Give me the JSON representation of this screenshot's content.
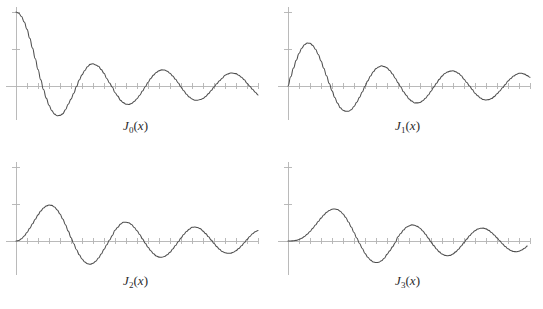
{
  "figure": {
    "background_color": "#ffffff",
    "curve_color": "#4d4d4d",
    "axis_color": "#b3b3b3",
    "label_color": "#2b2b2b"
  },
  "panels": [
    {
      "name": "panel-j0",
      "label_fn": "J",
      "label_sub": "0",
      "label_open": "(",
      "label_arg": "x",
      "label_close": ")",
      "label_text": "J0(x)",
      "order": 0
    },
    {
      "name": "panel-j1",
      "label_fn": "J",
      "label_sub": "1",
      "label_open": "(",
      "label_arg": "x",
      "label_close": ")",
      "label_text": "J1(x)",
      "order": 1
    },
    {
      "name": "panel-j2",
      "label_fn": "J",
      "label_sub": "2",
      "label_open": "(",
      "label_arg": "x",
      "label_close": ")",
      "label_text": "J2(x)",
      "order": 2
    },
    {
      "name": "panel-j3",
      "label_fn": "J",
      "label_sub": "3",
      "label_open": "(",
      "label_arg": "x",
      "label_close": ")",
      "label_text": "J3(x)",
      "order": 3
    }
  ],
  "chart_data": [
    {
      "type": "line",
      "title": "J0(x)",
      "xlabel": "",
      "ylabel": "",
      "xlim": [
        0,
        22
      ],
      "ylim": [
        -0.7,
        1.1
      ],
      "grid": false,
      "legend": "none",
      "axis_ticks": {
        "x_step": 1,
        "x_ticks": [
          0,
          1,
          2,
          3,
          4,
          5,
          6,
          7,
          8,
          9,
          10,
          11,
          12,
          13,
          14,
          15,
          16,
          17,
          18,
          19,
          20,
          21,
          22
        ],
        "y_ticks": [
          -0.5,
          0.0,
          0.5,
          1.0
        ]
      },
      "series": [
        {
          "name": "J0",
          "x": [
            0,
            0.25,
            0.5,
            0.75,
            1,
            1.25,
            1.5,
            1.75,
            2,
            2.25,
            2.5,
            2.75,
            3,
            3.25,
            3.5,
            3.75,
            4,
            4.25,
            4.5,
            4.75,
            5,
            5.25,
            5.5,
            5.75,
            6,
            6.25,
            6.5,
            6.75,
            7,
            7.25,
            7.5,
            7.75,
            8,
            8.25,
            8.5,
            8.75,
            9,
            9.25,
            9.5,
            9.75,
            10,
            10.25,
            10.5,
            10.75,
            11,
            11.25,
            11.5,
            11.75,
            12,
            12.25,
            12.5,
            12.75,
            13,
            13.25,
            13.5,
            13.75,
            14,
            14.25,
            14.5,
            14.75,
            15,
            15.25,
            15.5,
            15.75,
            16,
            16.25,
            16.5,
            16.75,
            17,
            17.25,
            17.5,
            17.75,
            18,
            18.25,
            18.5,
            18.75,
            19,
            19.25,
            19.5,
            19.75,
            20,
            20.25,
            20.5,
            20.75,
            21,
            21.25,
            21.5,
            21.75,
            22
          ],
          "values": [
            1.0,
            0.9844,
            0.9385,
            0.8642,
            0.7652,
            0.6459,
            0.5118,
            0.369,
            0.2239,
            0.0827,
            -0.0484,
            -0.1641,
            -0.2601,
            -0.3325,
            -0.3801,
            -0.4026,
            -0.3971,
            -0.3766,
            -0.3205,
            -0.2459,
            -0.1776,
            -0.0968,
            -0.0068,
            0.0802,
            0.1506,
            0.2095,
            0.2601,
            0.2921,
            0.3001,
            0.2851,
            0.2663,
            0.2214,
            0.1717,
            0.1024,
            0.0419,
            -0.0142,
            -0.0903,
            -0.1367,
            -0.1939,
            -0.2243,
            -0.2459,
            -0.249,
            -0.2366,
            -0.2097,
            -0.1712,
            -0.124,
            -0.0677,
            -0.0095,
            0.0477,
            0.1023,
            0.1469,
            0.1823,
            0.2069,
            0.2183,
            0.215,
            0.2005,
            0.1711,
            0.1339,
            0.0903,
            0.0415,
            -0.0142,
            -0.0648,
            -0.1114,
            -0.1498,
            -0.1749,
            -0.1912,
            -0.1928,
            -0.1831,
            -0.1699,
            -0.141,
            -0.1029,
            -0.0614,
            -0.0134,
            0.0297,
            0.0714,
            0.1057,
            0.1466,
            0.1624,
            0.1756,
            0.1732,
            0.167,
            0.1441,
            0.118,
            0.0836,
            0.0366,
            -0.0031,
            -0.0447,
            -0.0845,
            -0.1207
          ]
        }
      ]
    },
    {
      "type": "line",
      "title": "J1(x)",
      "xlabel": "",
      "ylabel": "",
      "xlim": [
        0,
        22
      ],
      "ylim": [
        -0.7,
        1.1
      ],
      "grid": false,
      "legend": "none",
      "axis_ticks": {
        "x_step": 1,
        "x_ticks": [
          0,
          1,
          2,
          3,
          4,
          5,
          6,
          7,
          8,
          9,
          10,
          11,
          12,
          13,
          14,
          15,
          16,
          17,
          18,
          19,
          20,
          21,
          22
        ],
        "y_ticks": [
          -0.5,
          0.0,
          0.5,
          1.0
        ]
      },
      "series": [
        {
          "name": "J1",
          "x": [
            0,
            0.25,
            0.5,
            0.75,
            1,
            1.25,
            1.5,
            1.75,
            2,
            2.25,
            2.5,
            2.75,
            3,
            3.25,
            3.5,
            3.75,
            4,
            4.25,
            4.5,
            4.75,
            5,
            5.25,
            5.5,
            5.75,
            6,
            6.25,
            6.5,
            6.75,
            7,
            7.25,
            7.5,
            7.75,
            8,
            8.25,
            8.5,
            8.75,
            9,
            9.25,
            9.5,
            9.75,
            10,
            10.25,
            10.5,
            10.75,
            11,
            11.25,
            11.5,
            11.75,
            12,
            12.25,
            12.5,
            12.75,
            13,
            13.25,
            13.5,
            13.75,
            14,
            14.25,
            14.5,
            14.75,
            15,
            15.25,
            15.5,
            15.75,
            16,
            16.25,
            16.5,
            16.75,
            17,
            17.25,
            17.5,
            17.75,
            18,
            18.25,
            18.5,
            18.75,
            19,
            19.25,
            19.5,
            19.75,
            20,
            20.25,
            20.5,
            20.75,
            21,
            21.25,
            21.5,
            21.75,
            22
          ],
          "values": [
            0.0,
            0.124,
            0.2423,
            0.3492,
            0.4401,
            0.5106,
            0.5579,
            0.5802,
            0.5767,
            0.5484,
            0.4971,
            0.426,
            0.3391,
            0.2412,
            0.1374,
            0.0333,
            -0.066,
            -0.1558,
            -0.2311,
            -0.2944,
            -0.3276,
            -0.3414,
            -0.3414,
            -0.3209,
            -0.2767,
            -0.2196,
            -0.1538,
            -0.0818,
            -0.0047,
            0.0693,
            0.1352,
            0.1934,
            0.2346,
            0.258,
            0.2731,
            0.2621,
            0.2453,
            0.2098,
            0.1613,
            0.1061,
            0.0435,
            -0.0134,
            -0.0789,
            -0.1244,
            -0.1768,
            -0.2037,
            -0.2284,
            -0.2282,
            -0.2234,
            -0.1987,
            -0.1655,
            -0.121,
            -0.0703,
            -0.015,
            0.038,
            0.0893,
            0.1334,
            0.1677,
            0.1895,
            0.2012,
            0.2051,
            0.1924,
            0.1711,
            0.1395,
            0.0904,
            0.0478,
            -0.0007,
            -0.0462,
            -0.0977,
            -0.1328,
            -0.1625,
            -0.1829,
            -0.188,
            -0.1839,
            -0.1695,
            -0.1435,
            -0.1057,
            -0.0678,
            -0.0244,
            0.0188,
            0.0668,
            0.101,
            0.1345,
            0.1553,
            0.1711,
            0.1719,
            0.1606,
            0.1404,
            0.1173
          ]
        }
      ]
    },
    {
      "type": "line",
      "title": "J2(x)",
      "xlabel": "",
      "ylabel": "",
      "xlim": [
        0,
        22
      ],
      "ylim": [
        -0.7,
        1.1
      ],
      "grid": false,
      "legend": "none",
      "axis_ticks": {
        "x_step": 1,
        "x_ticks": [
          0,
          1,
          2,
          3,
          4,
          5,
          6,
          7,
          8,
          9,
          10,
          11,
          12,
          13,
          14,
          15,
          16,
          17,
          18,
          19,
          20,
          21,
          22
        ],
        "y_ticks": [
          -0.5,
          0.0,
          0.5,
          1.0
        ]
      },
      "series": [
        {
          "name": "J2",
          "x": [
            0,
            0.25,
            0.5,
            0.75,
            1,
            1.25,
            1.5,
            1.75,
            2,
            2.25,
            2.5,
            2.75,
            3,
            3.25,
            3.5,
            3.75,
            4,
            4.25,
            4.5,
            4.75,
            5,
            5.25,
            5.5,
            5.75,
            6,
            6.25,
            6.5,
            6.75,
            7,
            7.25,
            7.5,
            7.75,
            8,
            8.25,
            8.5,
            8.75,
            9,
            9.25,
            9.5,
            9.75,
            10,
            10.25,
            10.5,
            10.75,
            11,
            11.25,
            11.5,
            11.75,
            12,
            12.25,
            12.5,
            12.75,
            13,
            13.25,
            13.5,
            13.75,
            14,
            14.25,
            14.5,
            14.75,
            15,
            15.25,
            15.5,
            15.75,
            16,
            16.25,
            16.5,
            16.75,
            17,
            17.25,
            17.5,
            17.75,
            18,
            18.25,
            18.5,
            18.75,
            19,
            19.25,
            19.5,
            19.75,
            20,
            20.25,
            20.5,
            20.75,
            21,
            21.25,
            21.5,
            21.75,
            22
          ],
          "values": [
            0.0,
            0.0078,
            0.0306,
            0.0671,
            0.1149,
            0.1711,
            0.2321,
            0.294,
            0.3528,
            0.4046,
            0.4461,
            0.4743,
            0.4861,
            0.4813,
            0.4586,
            0.4193,
            0.3641,
            0.2963,
            0.2178,
            0.1334,
            0.0466,
            -0.0381,
            -0.1173,
            -0.1865,
            -0.2429,
            -0.2836,
            -0.3074,
            -0.3132,
            -0.3014,
            -0.2728,
            -0.2303,
            -0.1769,
            -0.113,
            -0.0509,
            0.0123,
            0.0724,
            0.1448,
            0.1858,
            0.2279,
            0.2526,
            0.2546,
            0.2464,
            0.2235,
            0.1833,
            0.139,
            0.0868,
            0.0289,
            -0.0291,
            -0.0849,
            -0.1325,
            -0.173,
            -0.2016,
            -0.2177,
            -0.2199,
            -0.2089,
            -0.1853,
            -0.152,
            -0.1093,
            -0.0608,
            -0.0096,
            0.0416,
            0.0881,
            0.128,
            0.1593,
            0.1862,
            0.188,
            0.1826,
            0.1676,
            0.1334,
            0.0996,
            0.0569,
            0.0117,
            -0.0337,
            -0.0757,
            -0.1124,
            -0.1428,
            -0.1578,
            -0.1667,
            -0.1664,
            -0.1522,
            -0.1314,
            -0.1026,
            -0.0654,
            -0.0232,
            0.0201,
            0.0616,
            0.0972,
            0.1256,
            0.1414
          ]
        }
      ]
    },
    {
      "type": "line",
      "title": "J3(x)",
      "xlabel": "",
      "ylabel": "",
      "xlim": [
        0,
        22
      ],
      "ylim": [
        -0.7,
        1.1
      ],
      "grid": false,
      "legend": "none",
      "axis_ticks": {
        "x_step": 1,
        "x_ticks": [
          0,
          1,
          2,
          3,
          4,
          5,
          6,
          7,
          8,
          9,
          10,
          11,
          12,
          13,
          14,
          15,
          16,
          17,
          18,
          19,
          20,
          21,
          22
        ],
        "y_ticks": [
          -0.5,
          0.0,
          0.5,
          1.0
        ]
      },
      "series": [
        {
          "name": "J3",
          "x": [
            0,
            0.25,
            0.5,
            0.75,
            1,
            1.25,
            1.5,
            1.75,
            2,
            2.25,
            2.5,
            2.75,
            3,
            3.25,
            3.5,
            3.75,
            4,
            4.25,
            4.5,
            4.75,
            5,
            5.25,
            5.5,
            5.75,
            6,
            6.25,
            6.5,
            6.75,
            7,
            7.25,
            7.5,
            7.75,
            8,
            8.25,
            8.5,
            8.75,
            9,
            9.25,
            9.5,
            9.75,
            10,
            10.25,
            10.5,
            10.75,
            11,
            11.25,
            11.5,
            11.75,
            12,
            12.25,
            12.5,
            12.75,
            13,
            13.25,
            13.5,
            13.75,
            14,
            14.25,
            14.5,
            14.75,
            15,
            15.25,
            15.5,
            15.75,
            16,
            16.25,
            16.5,
            16.75,
            17,
            17.25,
            17.5,
            17.75,
            18,
            18.25,
            18.5,
            18.75,
            19,
            19.25,
            19.5,
            19.75,
            20,
            20.25,
            20.5,
            20.75,
            21,
            21.25,
            21.5,
            21.75,
            22
          ],
          "values": [
            0.0,
            0.0003,
            0.0026,
            0.0085,
            0.0196,
            0.0369,
            0.061,
            0.0919,
            0.1289,
            0.1707,
            0.2166,
            0.2626,
            0.3091,
            0.3504,
            0.3868,
            0.4121,
            0.4302,
            0.4333,
            0.4247,
            0.402,
            0.3648,
            0.3166,
            0.2561,
            0.188,
            0.1148,
            0.0405,
            -0.0327,
            -0.1003,
            -0.1676,
            -0.2185,
            -0.2581,
            -0.284,
            -0.2911,
            -0.2874,
            -0.2662,
            -0.2329,
            -0.1809,
            -0.1333,
            -0.0793,
            -0.023,
            0.0583,
            0.1012,
            0.1474,
            0.1856,
            0.2027,
            0.2183,
            0.2134,
            0.1975,
            0.173,
            0.136,
            0.0919,
            0.0392,
            -0.0118,
            -0.0627,
            -0.108,
            -0.147,
            -0.1768,
            -0.194,
            -0.1991,
            -0.194,
            -0.1748,
            -0.147,
            -0.1101,
            -0.0676,
            -0.0217,
            0.0256,
            0.0697,
            0.1083,
            0.139,
            0.1618,
            0.1734,
            0.1738,
            0.1638,
            0.1437,
            0.1154,
            0.0807,
            0.042,
            0.0017,
            -0.0385,
            -0.0752,
            -0.106,
            -0.1286,
            -0.142,
            -0.1452,
            -0.1384,
            -0.1224,
            -0.0985,
            -0.0686
          ]
        }
      ]
    }
  ]
}
